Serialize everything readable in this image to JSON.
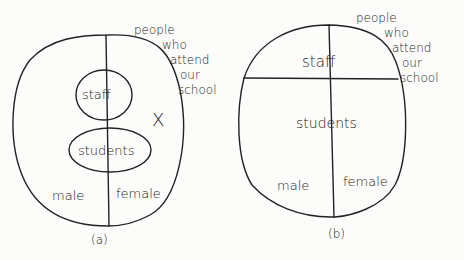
{
  "diagram_a": {
    "outer_label": [
      "people",
      "who",
      "attend",
      "our",
      "school"
    ],
    "inner_top": "staff",
    "inner_bottom": "students",
    "left_region": "male",
    "right_region": "female",
    "mark": "X",
    "caption": "(a)"
  },
  "diagram_b": {
    "outer_label": [
      "people",
      "who",
      "attend",
      "our",
      "school"
    ],
    "top_region": "staff",
    "bottom_region": "students",
    "left_region": "male",
    "right_region": "female",
    "caption": "(b)"
  }
}
